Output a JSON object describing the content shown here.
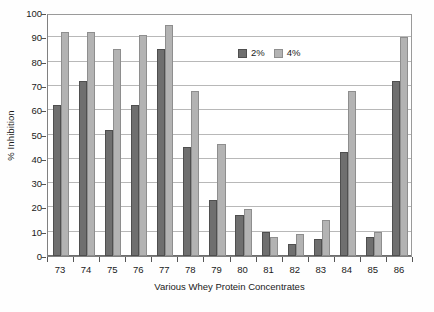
{
  "chart_data": {
    "type": "bar",
    "title": "",
    "xlabel": "Various Whey Protein Concentrates",
    "ylabel": "% Inhibition",
    "ylim": [
      0,
      100
    ],
    "ytick_step": 10,
    "yticks": [
      100,
      90,
      80,
      70,
      60,
      50,
      40,
      30,
      20,
      10,
      0
    ],
    "grid": true,
    "legend_position": "inside-top-right",
    "categories": [
      "73",
      "74",
      "75",
      "76",
      "77",
      "78",
      "79",
      "80",
      "81",
      "82",
      "83",
      "84",
      "85",
      "86"
    ],
    "series": [
      {
        "name": "2%",
        "color": "#6f6f6f",
        "values": [
          62,
          72,
          52,
          62,
          85,
          45,
          23,
          17,
          10,
          5,
          7,
          43,
          8,
          72
        ]
      },
      {
        "name": "4%",
        "color": "#b3b3b3",
        "values": [
          92,
          92,
          85,
          91,
          95,
          68,
          46,
          19.5,
          8,
          9,
          15,
          68,
          10,
          90
        ]
      }
    ]
  },
  "legend": {
    "entries": [
      {
        "label": "2%",
        "swatch": "dark-gray-swatch-icon"
      },
      {
        "label": "4%",
        "swatch": "light-gray-swatch-icon"
      }
    ]
  },
  "axes": {
    "y_title": "% Inhibition",
    "x_title": "Various Whey Protein Concentrates"
  }
}
